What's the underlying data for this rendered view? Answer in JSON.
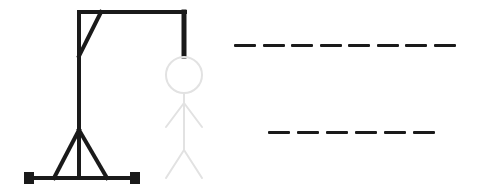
{
  "game": {
    "name": "hangman",
    "colors": {
      "gallows": "#1a1a1a",
      "figure_ghost": "#e2e2e2",
      "blank": "#1a1a1a",
      "background": "#ffffff"
    },
    "figure_parts_shown": [
      "head",
      "body",
      "left-arm",
      "right-arm",
      "left-leg",
      "right-leg"
    ],
    "figure_state": "faded"
  },
  "words": [
    {
      "length": 8,
      "letters": [
        "",
        "",
        "",
        "",
        "",
        "",
        "",
        ""
      ]
    },
    {
      "length": 6,
      "letters": [
        "",
        "",
        "",
        "",
        "",
        ""
      ]
    }
  ]
}
